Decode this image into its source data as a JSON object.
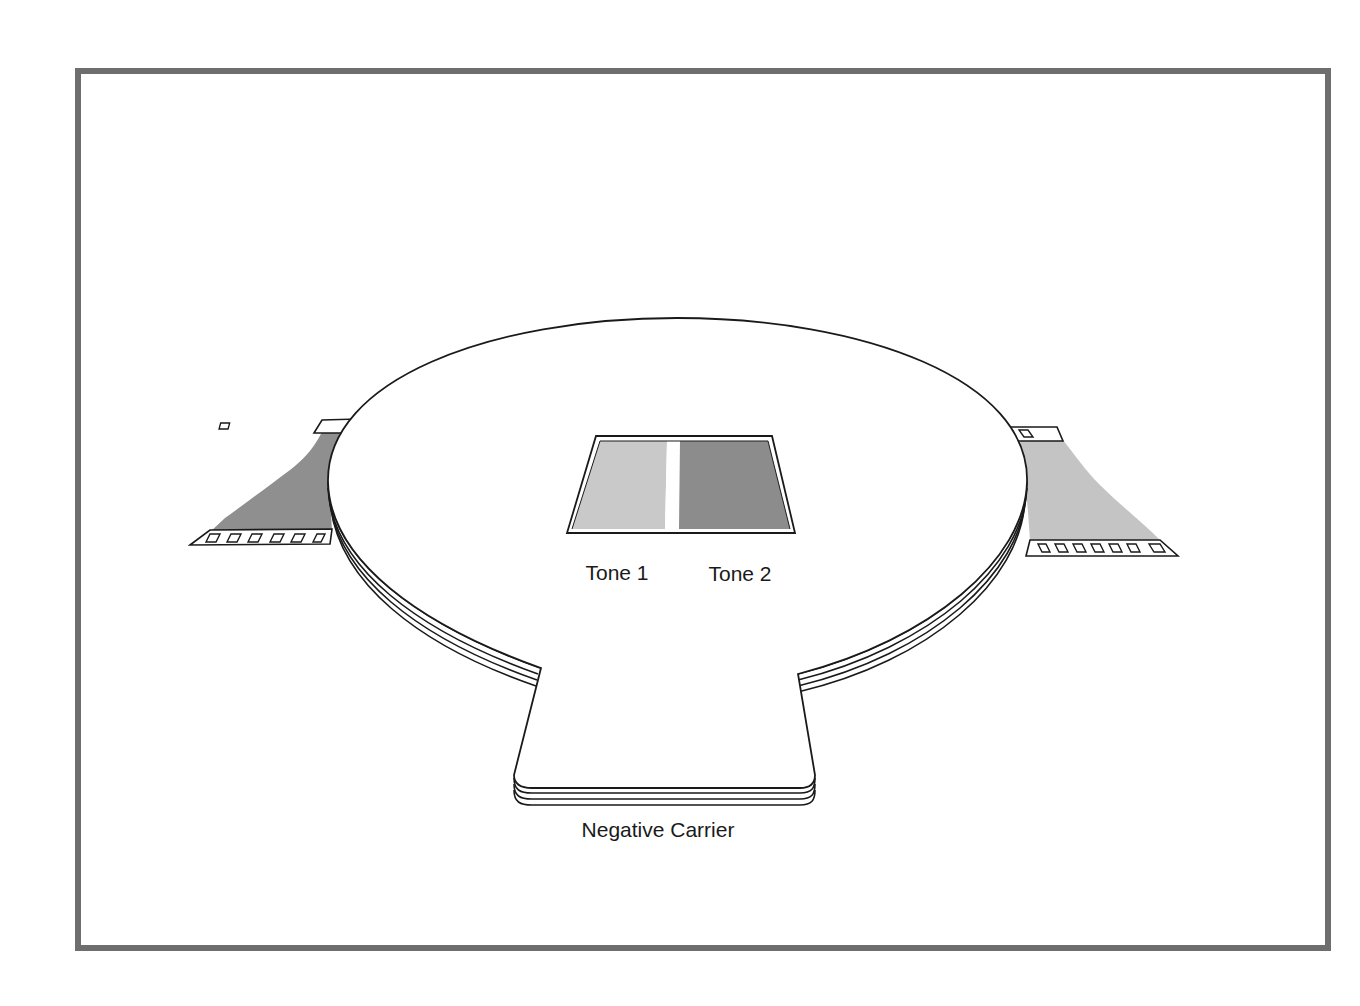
{
  "figure": {
    "labels": {
      "tone1": "Tone 1",
      "tone2": "Tone 2",
      "carrier": "Negative Carrier"
    },
    "colors": {
      "frame": "#6e6e6e",
      "tone1_fill": "#c9c9c9",
      "tone2_fill": "#8c8c8c",
      "left_film_fill": "#8f8f8f",
      "right_film_fill": "#c4c4c4",
      "outline": "#1a1a1a"
    },
    "components": [
      {
        "id": "negative-carrier",
        "label": "Negative Carrier"
      },
      {
        "id": "window-tone-1",
        "label": "Tone 1"
      },
      {
        "id": "window-tone-2",
        "label": "Tone 2"
      },
      {
        "id": "film-strip-left",
        "label": ""
      },
      {
        "id": "film-strip-right",
        "label": ""
      }
    ]
  }
}
